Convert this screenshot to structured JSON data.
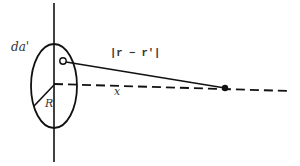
{
  "diagram": {
    "labels": {
      "area_element": "da'",
      "separation": "|r − r'|",
      "axis_distance": "x",
      "radius": "R"
    },
    "elements": {
      "axis": "vertical line through disk center",
      "disk": "ellipse (disk seen in perspective)",
      "source_point": "small open circle (area element da')",
      "field_point": "filled dot on axis",
      "separation_line": "solid line from area element to field point",
      "axis_line": "dashed line along axis x",
      "radius_line": "solid line from center to rim"
    },
    "colors": {
      "stroke": "#111111",
      "text": "#333333",
      "background": "#ffffff"
    }
  }
}
